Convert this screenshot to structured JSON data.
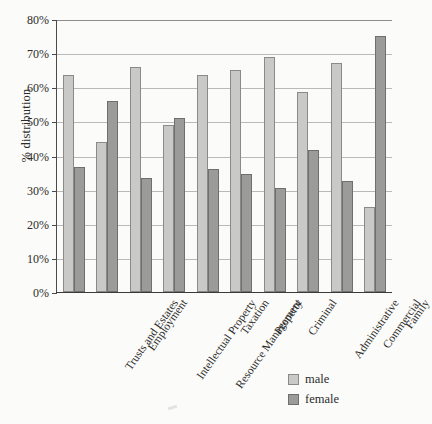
{
  "chart_data": {
    "type": "bar",
    "title": "",
    "xlabel": "",
    "ylabel": "% distribution",
    "ylim": [
      0,
      80
    ],
    "ytick_labels": [
      "80%",
      "70%",
      "60%",
      "50%",
      "40%",
      "30%",
      "20%",
      "10%",
      "0%"
    ],
    "ytick_values": [
      80,
      70,
      60,
      50,
      40,
      30,
      20,
      10,
      0
    ],
    "grid": true,
    "legend_position": "bottom-right",
    "categories": [
      "Trusts and Estates",
      "Employment",
      "Intellectual Property",
      "Resource Management",
      "Taxation",
      "Property",
      "Criminal",
      "Administrative",
      "Commercial",
      "Family"
    ],
    "series": [
      {
        "name": "male",
        "color": "#c9c9c7",
        "values": [
          63.5,
          44,
          66,
          49,
          63.5,
          65,
          69,
          58.5,
          67,
          25
        ]
      },
      {
        "name": "female",
        "color": "#9b9b99",
        "values": [
          36.5,
          56,
          33.5,
          51,
          36,
          34.5,
          30.5,
          41.5,
          32.5,
          75
        ]
      }
    ]
  },
  "legend": {
    "entries": [
      {
        "label": "male",
        "swatch": "male"
      },
      {
        "label": "female",
        "swatch": "female"
      }
    ]
  }
}
